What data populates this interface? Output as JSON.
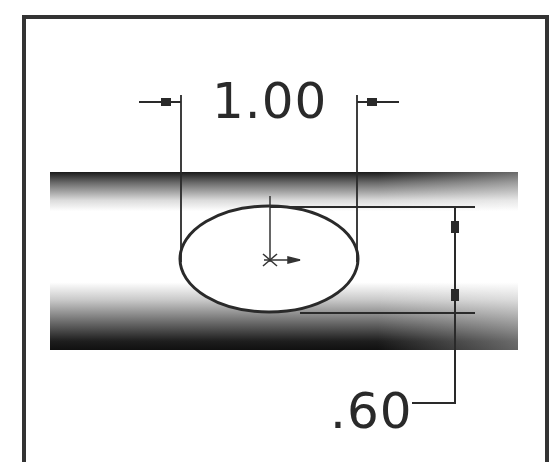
{
  "drawing": {
    "frame": {
      "stroke": "#333333",
      "left": 23,
      "top": 16,
      "right": 548,
      "open_bottom": true
    },
    "cylinder": {
      "x": 50,
      "y": 172,
      "width": 468,
      "height": 178,
      "dark": "#1a1a1a",
      "light": "#ffffff"
    },
    "ellipse": {
      "cx": 269,
      "cy": 258,
      "rx": 89,
      "ry": 53,
      "stroke": "#2a2a2a"
    },
    "center_mark": "centerpoint-with-direction-arrow"
  },
  "dimensions": {
    "width": {
      "label": "1.00",
      "value": 1.0,
      "orientation": "horizontal",
      "arrow_style": "outside"
    },
    "height": {
      "label": ".60",
      "value": 0.6,
      "orientation": "vertical",
      "arrow_style": "inside"
    }
  }
}
